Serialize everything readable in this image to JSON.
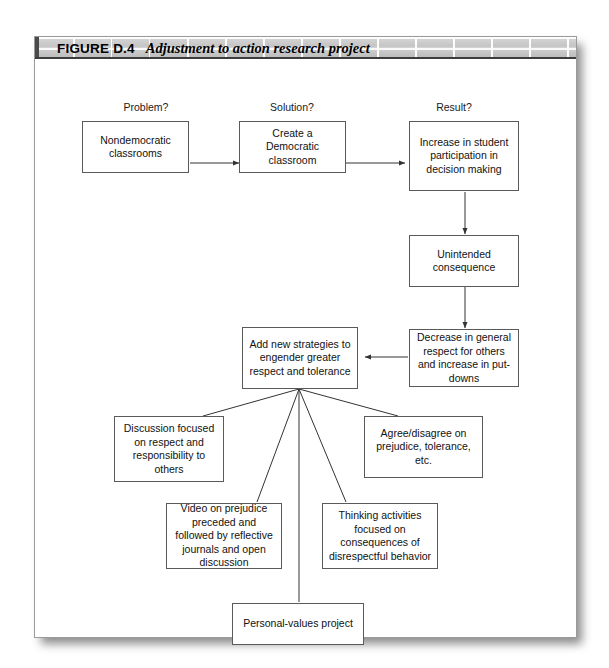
{
  "figure": {
    "number": "FIGURE D.4",
    "caption": "Adjustment to action research project"
  },
  "column_labels": [
    {
      "id": "problem",
      "text": "Problem?"
    },
    {
      "id": "solution",
      "text": "Solution?"
    },
    {
      "id": "result",
      "text": "Result?"
    }
  ],
  "nodes": {
    "nondemocratic": "Nondemocratic classrooms",
    "create_democratic": "Create a Democratic classroom",
    "increase_participation": "Increase in student participation in decision making",
    "unintended": "Unintended consequence",
    "decrease_respect": "Decrease in general respect for others and increase in put-downs",
    "add_strategies": "Add new strategies to engender greater respect and tolerance",
    "discussion": "Discussion focused on respect and responsibility to others",
    "agree_disagree": "Agree/disagree on prejudice, tolerance, etc.",
    "video": "Video on prejudice preceded and followed by reflective journals and open discussion",
    "thinking": "Thinking activities focused on consequences of disrespectful behavior",
    "personal_values": "Personal-values project"
  },
  "colors": {
    "node_border": "#5a5a5a",
    "connector": "#333333",
    "header_band": "#c8c8c8",
    "page_background": "#ffffff",
    "text": "#111111"
  }
}
